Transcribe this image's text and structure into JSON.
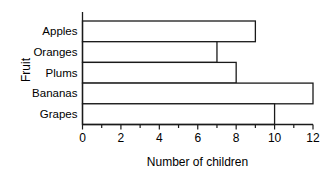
{
  "chart_data": {
    "type": "bar",
    "orientation": "horizontal",
    "title": "",
    "xlabel": "Number of children",
    "ylabel": "Fruit",
    "categories": [
      "Apples",
      "Oranges",
      "Plums",
      "Bananas",
      "Grapes"
    ],
    "values": [
      9,
      7,
      8,
      12,
      10
    ],
    "xlim": [
      0,
      12
    ],
    "xticks": [
      0,
      2,
      4,
      6,
      8,
      10,
      12
    ],
    "xtick_labels": [
      "0",
      "2",
      "4",
      "6",
      "8",
      "10",
      "12"
    ],
    "minor_tick_step": 1,
    "grid": false,
    "legend": null,
    "bar_fill_color": "#ffffff",
    "bar_edge_color": "#1a1a1a",
    "axis_color": "#1a1a1a",
    "background_color": "#ffffff"
  }
}
